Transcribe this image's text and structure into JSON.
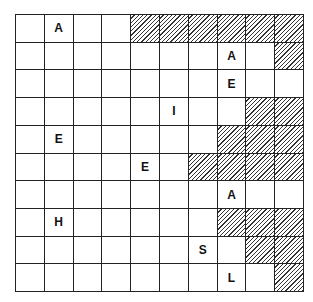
{
  "puzzle": {
    "rows": 10,
    "cols": 10,
    "grid": [
      [
        "",
        "A",
        "",
        "",
        "#",
        "#",
        "#",
        "#",
        "#",
        "#"
      ],
      [
        "",
        "",
        "",
        "",
        "",
        "",
        "",
        "A",
        "",
        "#"
      ],
      [
        "",
        "",
        "",
        "",
        "",
        "",
        "",
        "E",
        "",
        ""
      ],
      [
        "",
        "",
        "",
        "",
        "",
        "I",
        "",
        "",
        "#",
        "#"
      ],
      [
        "",
        "E",
        "",
        "",
        "",
        "",
        "",
        "#",
        "#",
        "#"
      ],
      [
        "",
        "",
        "",
        "",
        "E",
        "",
        "#",
        "#",
        "#",
        "#"
      ],
      [
        "",
        "",
        "",
        "",
        "",
        "",
        "",
        "A",
        "",
        ""
      ],
      [
        "",
        "H",
        "",
        "",
        "",
        "",
        "",
        "#",
        "#",
        "#"
      ],
      [
        "",
        "",
        "",
        "",
        "",
        "",
        "S",
        "",
        "#",
        "#"
      ],
      [
        "",
        "",
        "",
        "",
        "",
        "",
        "",
        "L",
        "",
        "#"
      ]
    ]
  }
}
